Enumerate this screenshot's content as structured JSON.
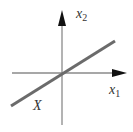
{
  "diagram": {
    "type": "coordinate-axes-with-line",
    "axes": {
      "horizontal": {
        "label": "x",
        "subscript": "1"
      },
      "vertical": {
        "label": "x",
        "subscript": "2"
      }
    },
    "line": {
      "label": "X",
      "description": "line through origin with positive slope"
    },
    "colors": {
      "axis": "#8a8a8a",
      "arrowhead": "#111111",
      "line": "#6b6b6b",
      "text": "#333333",
      "background": "#ffffff"
    }
  }
}
